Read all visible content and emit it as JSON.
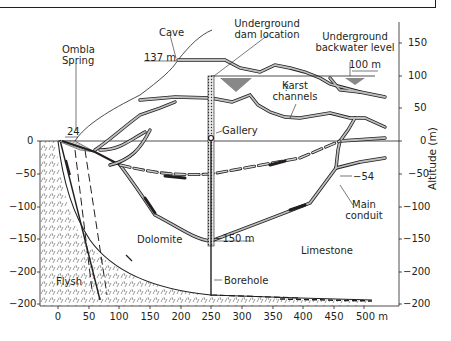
{
  "figure": {
    "labels": {
      "cave": "Cave",
      "cave_elev": "137 m",
      "ombla_line1": "Ombla",
      "ombla_line2": "Spring",
      "spring_elev": "24",
      "dam_line1": "Underground",
      "dam_line2": "dam location",
      "backwater_line1": "Underground",
      "backwater_line2": "backwater level",
      "backwater_elev": "100 m",
      "question": "?",
      "karst_line1": "Karst",
      "karst_line2": "channels",
      "gallery": "Gallery",
      "main_conduit_line1": "Main",
      "main_conduit_line2": "conduit",
      "conduit_elev": "−54",
      "borehole_bottom": "−150 m",
      "dolomite": "Dolomite",
      "limestone": "Limestone",
      "borehole": "Borehole",
      "flysh": "Flysh"
    },
    "y_axis": {
      "label": "Altitude (m)",
      "ticks": [
        "150",
        "100",
        "50",
        "0",
        "−50",
        "−100",
        "−150",
        "−200",
        "−200"
      ]
    },
    "left_axis": {
      "ticks": [
        "0",
        "−50",
        "−100",
        "−150",
        "−200",
        "−200"
      ]
    },
    "x_axis": {
      "ticks": [
        "0",
        "50",
        "100",
        "150",
        "200",
        "250",
        "300",
        "350",
        "400",
        "450",
        "500 m"
      ]
    },
    "colors": {
      "ink": "#231f20",
      "channel_fill": "#bdbdbd",
      "hatch": "#555555"
    }
  }
}
